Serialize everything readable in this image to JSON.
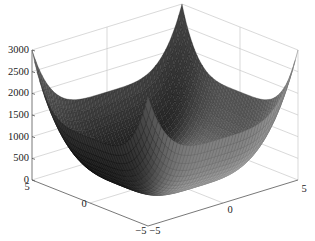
{
  "chart_data": {
    "type": "surface",
    "title": "",
    "xlabel": "",
    "ylabel": "",
    "zlabel": "",
    "function": "z = 2.4*(x^4 + y^4)",
    "x_range": [
      -5,
      5
    ],
    "y_range": [
      -5,
      5
    ],
    "z_range": [
      0,
      3000
    ],
    "x_ticks": [
      -5,
      0,
      5
    ],
    "y_ticks": [
      -5,
      0,
      5
    ],
    "z_ticks": [
      0,
      500,
      1000,
      1500,
      2000,
      2500,
      3000
    ],
    "x_tick_labels": [
      "-5",
      "0",
      "5"
    ],
    "y_tick_labels": [
      "-5",
      "0",
      "5"
    ],
    "z_tick_labels": [
      "0",
      "500",
      "1000",
      "1500",
      "2000",
      "2500",
      "3000"
    ],
    "grid": true,
    "colormap": "gray",
    "mesh_lines": true,
    "corner_values": {
      "(-5,-5)": 3000,
      "(5,-5)": 3000,
      "(-5,5)": 3000,
      "(5,5)": 3000
    },
    "minimum": {
      "x": 0,
      "y": 0,
      "z": 0
    }
  },
  "labels": {
    "z_ticks": [
      "0",
      "500",
      "1000",
      "1500",
      "2000",
      "2500",
      "3000"
    ],
    "left_axis": [
      "5",
      "0",
      "-5"
    ],
    "right_axis": [
      "-5",
      "0",
      "5"
    ]
  }
}
